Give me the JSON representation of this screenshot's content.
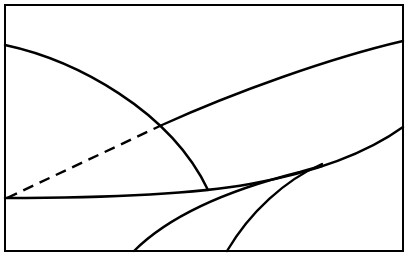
{
  "diagram": {
    "type": "line-curve-schematic",
    "labels": [],
    "colors": {
      "line": "#000000",
      "background": "#ffffff"
    },
    "frame": {
      "x": 5,
      "y": 5,
      "width": 398,
      "height": 246
    },
    "curves": [
      {
        "id": "descending-arc",
        "style": "solid",
        "points": [
          [
            5,
            45
          ],
          [
            90,
            70
          ],
          [
            162,
            125
          ],
          [
            208,
            190
          ]
        ]
      },
      {
        "id": "rising-curve-dashed-part",
        "style": "dashed",
        "points": [
          [
            7,
            198
          ],
          [
            162,
            125
          ]
        ]
      },
      {
        "id": "rising-curve-solid-part",
        "style": "solid",
        "points": [
          [
            162,
            125
          ],
          [
            290,
            72
          ],
          [
            403,
            41
          ]
        ]
      },
      {
        "id": "near-horizontal-curve",
        "style": "solid",
        "points": [
          [
            5,
            198
          ],
          [
            208,
            190
          ],
          [
            320,
            165
          ],
          [
            403,
            127
          ]
        ]
      },
      {
        "id": "lower-left-branch",
        "style": "solid",
        "points": [
          [
            134,
            251
          ],
          [
            200,
            205
          ],
          [
            300,
            170
          ]
        ]
      },
      {
        "id": "lower-right-branch",
        "style": "solid",
        "points": [
          [
            227,
            251
          ],
          [
            265,
            200
          ],
          [
            320,
            165
          ]
        ]
      }
    ],
    "intersections": [
      {
        "name": "upper-crossing",
        "x": 162,
        "y": 125
      },
      {
        "name": "arc-end-on-horizontal",
        "x": 208,
        "y": 190
      },
      {
        "name": "branch-merge",
        "x": 318,
        "y": 166
      }
    ]
  }
}
